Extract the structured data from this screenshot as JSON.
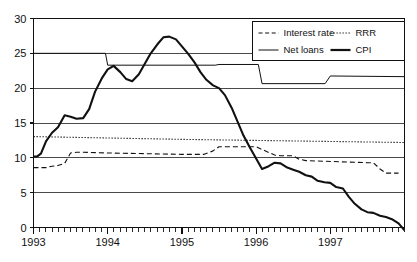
{
  "chart_data": {
    "type": "line",
    "title": "",
    "subtitle": "",
    "xlabel": "",
    "ylabel": "",
    "xlim": [
      1993.0,
      1998.0
    ],
    "ylim": [
      0,
      30
    ],
    "yticks": [
      0,
      5,
      10,
      15,
      20,
      25,
      30
    ],
    "ytick_labels": [
      "0",
      "5",
      "10",
      "15",
      "20",
      "25",
      "30"
    ],
    "xticks": [
      1993,
      1994,
      1995,
      1996,
      1997
    ],
    "xtick_labels": [
      "1993",
      "1994",
      "1995",
      "1996",
      "1997"
    ],
    "x_minor_tick_interval": 0.0833,
    "grid": "horizontal",
    "grid_on": true,
    "legend_position": "top-right",
    "legend_boxed": true,
    "series": [
      {
        "name": "Interest rate",
        "style": "dashed",
        "width": 1.1,
        "color": "#111111",
        "x": [
          1993.0,
          1993.08,
          1993.17,
          1993.25,
          1993.33,
          1993.42,
          1993.5,
          1993.58,
          1993.67,
          1994.0,
          1994.5,
          1995.0,
          1995.3,
          1995.42,
          1995.5,
          1995.58,
          1995.75,
          1996.0,
          1996.08,
          1996.25,
          1996.33,
          1996.5,
          1996.58,
          1996.67,
          1997.5,
          1997.58,
          1997.67,
          1997.75,
          1997.92
        ],
        "y": [
          8.6,
          8.6,
          8.6,
          8.8,
          8.9,
          9.2,
          10.7,
          10.8,
          10.8,
          10.7,
          10.6,
          10.5,
          10.5,
          11.0,
          11.6,
          11.6,
          11.6,
          11.6,
          11.2,
          10.4,
          10.3,
          10.3,
          9.8,
          9.6,
          9.3,
          9.3,
          8.4,
          7.8,
          7.8
        ]
      },
      {
        "name": "RRR",
        "style": "dotted",
        "width": 1.1,
        "color": "#111111",
        "x": [
          1993.0,
          1994.0,
          1995.0,
          1996.0,
          1997.0,
          1998.0
        ],
        "y": [
          13.05,
          12.85,
          12.65,
          12.5,
          12.35,
          12.2
        ]
      },
      {
        "name": "Net loans",
        "style": "solid",
        "width": 1.0,
        "color": "#111111",
        "x": [
          1993.0,
          1993.97,
          1994.0,
          1995.45,
          1995.5,
          1996.03,
          1996.08,
          1996.93,
          1997.0,
          1998.0
        ],
        "y": [
          25.0,
          25.0,
          23.3,
          23.3,
          23.4,
          23.4,
          20.65,
          20.65,
          21.75,
          21.65
        ]
      },
      {
        "name": "CPI",
        "style": "solid",
        "width": 2.1,
        "color": "#111111",
        "x": [
          1993.0,
          1993.05,
          1993.1,
          1993.17,
          1993.25,
          1993.33,
          1993.42,
          1993.5,
          1993.58,
          1993.67,
          1993.75,
          1993.83,
          1993.92,
          1994.0,
          1994.08,
          1994.17,
          1994.25,
          1994.33,
          1994.42,
          1994.5,
          1994.58,
          1994.67,
          1994.75,
          1994.83,
          1994.92,
          1995.0,
          1995.08,
          1995.17,
          1995.25,
          1995.33,
          1995.42,
          1995.5,
          1995.58,
          1995.67,
          1995.75,
          1995.83,
          1995.92,
          1996.0,
          1996.08,
          1996.17,
          1996.25,
          1996.33,
          1996.42,
          1996.5,
          1996.58,
          1996.67,
          1996.75,
          1996.83,
          1996.92,
          1997.0,
          1997.08,
          1997.17,
          1997.25,
          1997.33,
          1997.42,
          1997.5,
          1997.58,
          1997.67,
          1997.75,
          1997.83,
          1997.92,
          1998.0
        ],
        "y": [
          10.2,
          10.2,
          10.6,
          12.4,
          13.6,
          14.4,
          16.1,
          15.9,
          15.6,
          15.7,
          17.0,
          19.5,
          21.4,
          22.7,
          23.2,
          22.3,
          21.3,
          21.0,
          22.0,
          23.5,
          25.0,
          26.3,
          27.3,
          27.4,
          27.0,
          26.0,
          25.0,
          23.7,
          22.3,
          21.2,
          20.4,
          20.0,
          19.0,
          17.2,
          15.2,
          13.2,
          11.4,
          9.9,
          8.4,
          8.8,
          9.3,
          9.2,
          8.6,
          8.3,
          8.0,
          7.5,
          7.3,
          6.7,
          6.5,
          6.4,
          5.8,
          5.6,
          4.4,
          3.4,
          2.6,
          2.2,
          2.1,
          1.7,
          1.5,
          1.2,
          0.6,
          -0.4
        ]
      }
    ]
  },
  "legend": {
    "entries": [
      {
        "label": "Interest rate",
        "style": "dashed"
      },
      {
        "label": "RRR",
        "style": "dotted"
      },
      {
        "label": "Net loans",
        "style": "solid-thin"
      },
      {
        "label": "CPI",
        "style": "solid-thick"
      }
    ]
  },
  "colors": {
    "ink": "#111111",
    "grid": "#4a4a4a",
    "background": "#ffffff"
  }
}
